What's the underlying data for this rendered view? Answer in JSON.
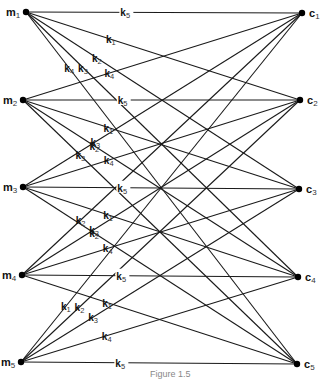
{
  "diagram": {
    "type": "complete-bipartite-graph",
    "left_nodes": [
      {
        "id": "m1",
        "base": "m",
        "sub": "1"
      },
      {
        "id": "m2",
        "base": "m",
        "sub": "2"
      },
      {
        "id": "m3",
        "base": "m",
        "sub": "3"
      },
      {
        "id": "m4",
        "base": "m",
        "sub": "4"
      },
      {
        "id": "m5",
        "base": "m",
        "sub": "5"
      }
    ],
    "right_nodes": [
      {
        "id": "c1",
        "base": "c",
        "sub": "1"
      },
      {
        "id": "c2",
        "base": "c",
        "sub": "2"
      },
      {
        "id": "c3",
        "base": "c",
        "sub": "3"
      },
      {
        "id": "c4",
        "base": "c",
        "sub": "4"
      },
      {
        "id": "c5",
        "base": "c",
        "sub": "5"
      }
    ],
    "edges": [
      {
        "from": "m1",
        "to": "c1",
        "label": "5"
      },
      {
        "from": "m1",
        "to": "c2",
        "label": "1"
      },
      {
        "from": "m1",
        "to": "c3",
        "label": "2"
      },
      {
        "from": "m1",
        "to": "c4",
        "label": "3"
      },
      {
        "from": "m1",
        "to": "c5",
        "label": "4"
      },
      {
        "from": "m2",
        "to": "c1",
        "label": "4"
      },
      {
        "from": "m2",
        "to": "c2",
        "label": "5"
      },
      {
        "from": "m2",
        "to": "c3",
        "label": "1"
      },
      {
        "from": "m2",
        "to": "c4",
        "label": "2"
      },
      {
        "from": "m2",
        "to": "c5",
        "label": "3"
      },
      {
        "from": "m3",
        "to": "c1",
        "label": "3"
      },
      {
        "from": "m3",
        "to": "c2",
        "label": "4"
      },
      {
        "from": "m3",
        "to": "c3",
        "label": "5"
      },
      {
        "from": "m3",
        "to": "c4",
        "label": "1"
      },
      {
        "from": "m3",
        "to": "c5",
        "label": "2"
      },
      {
        "from": "m4",
        "to": "c1",
        "label": "2"
      },
      {
        "from": "m4",
        "to": "c2",
        "label": "3"
      },
      {
        "from": "m4",
        "to": "c3",
        "label": "4"
      },
      {
        "from": "m4",
        "to": "c4",
        "label": "5"
      },
      {
        "from": "m4",
        "to": "c5",
        "label": "1"
      },
      {
        "from": "m5",
        "to": "c1",
        "label": "1"
      },
      {
        "from": "m5",
        "to": "c2",
        "label": "2"
      },
      {
        "from": "m5",
        "to": "c3",
        "label": "3"
      },
      {
        "from": "m5",
        "to": "c4",
        "label": "4"
      },
      {
        "from": "m5",
        "to": "c5",
        "label": "5"
      }
    ],
    "edge_label_base": "k",
    "caption": "Figure 1.5"
  }
}
